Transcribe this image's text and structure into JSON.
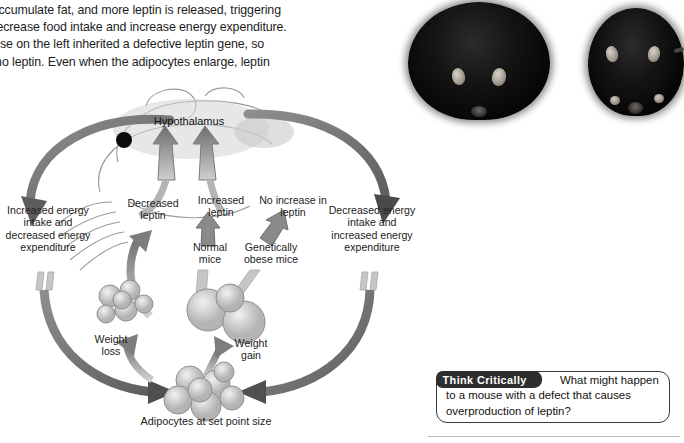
{
  "body_text": {
    "lines": [
      "ytes accumulate fat, and more leptin is released, triggering",
      "that decrease food intake and increase energy expenditure.",
      "e mouse on the left inherited a defective leptin gene, so",
      "uces no leptin. Even when the adipocytes enlarge, leptin"
    ]
  },
  "photo": {
    "obese_mouse_alt": "obese-mouse",
    "normal_mouse_alt": "normal-mouse"
  },
  "diagram": {
    "hypothalamus": "Hypothalamus",
    "decreased_leptin": "Decreased leptin",
    "increased_leptin": "Increased leptin",
    "no_increase_leptin": "No increase in leptin",
    "increased_intake": "Increased energy intake and decreased energy expenditure",
    "decreased_intake": "Decreased energy intake and increased energy expenditure",
    "normal_mice": "Normal mice",
    "obese_mice": "Genetically obese mice",
    "weight_loss": "Weight loss",
    "weight_gain": "Weight gain",
    "adipocytes_caption": "Adipocytes at set point size"
  },
  "think_critically": {
    "tab_label": "Think Critically",
    "question": "What might happen to a mouse with a defect that causes overproduction of leptin?"
  },
  "colors": {
    "arrow_gray": "#6a6a6a",
    "arrow_dark": "#545454",
    "tab_dark": "#2e2e2e",
    "text": "#232323"
  }
}
